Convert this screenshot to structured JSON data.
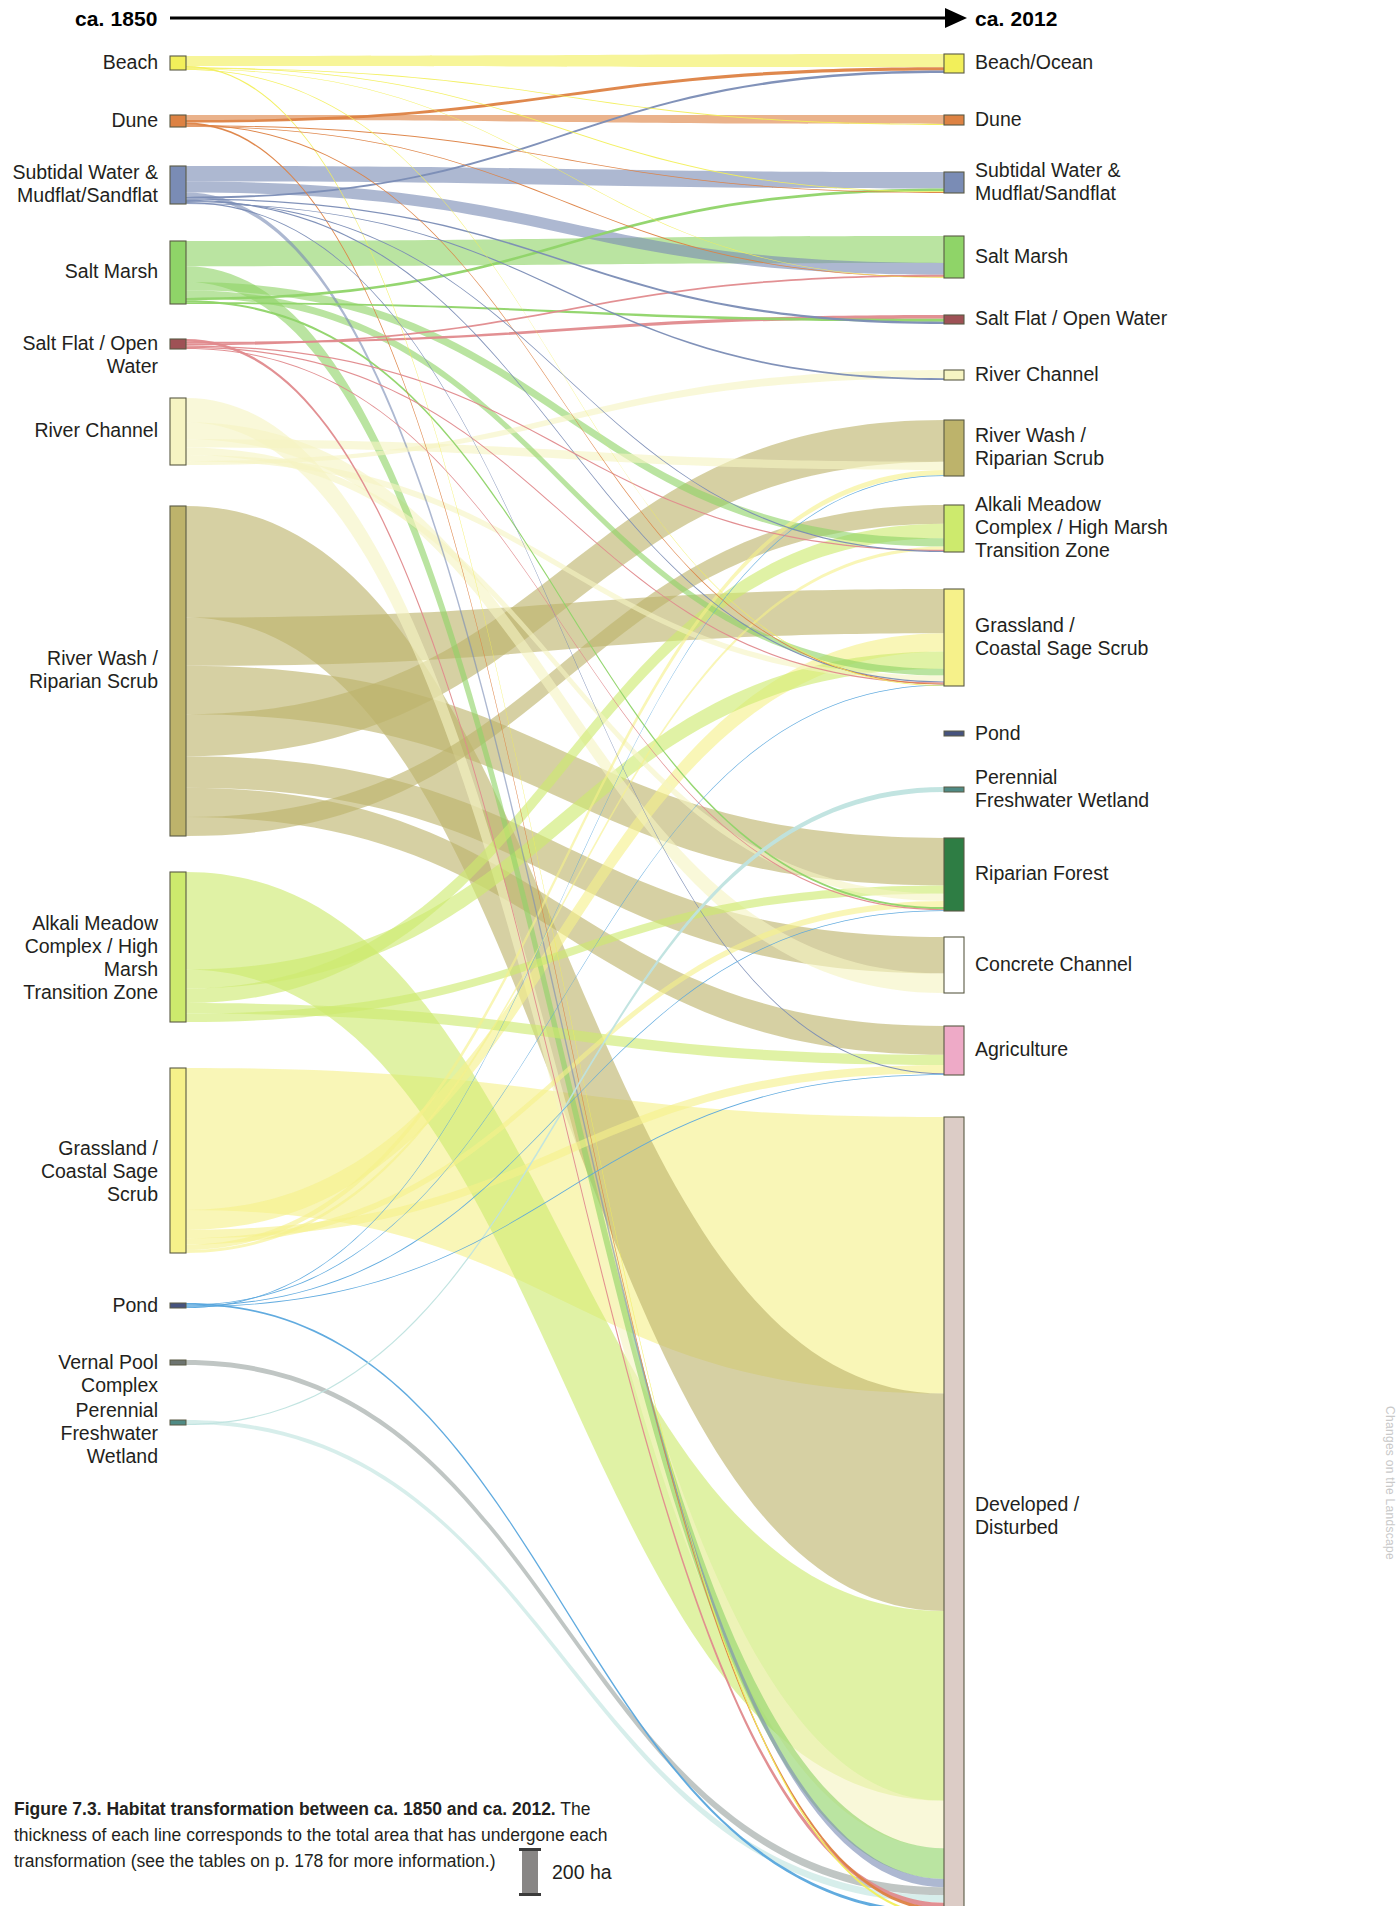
{
  "figure": {
    "axis_left_label": "ca. 1850",
    "axis_right_label": "ca. 2012",
    "caption_title": "Figure 7.3. Habitat transformation between ca. 1850 and ca. 2012.",
    "caption_body": "The thickness of each line corresponds to the total area that has undergone each transformation (see the tables on p. 178 for more information.)",
    "scale_label": "200 ha",
    "side_note": "Changes on the Landscape"
  },
  "chart_data": {
    "type": "sankey",
    "title": "Habitat transformation between ca. 1850 and ca. 2012",
    "units": "ha",
    "scale_reference_ha": 200,
    "scale_reference_px": 42,
    "xlabel": "",
    "ylabel": "",
    "legend_position": "none",
    "grid": false,
    "source_axis": "ca. 1850",
    "target_axis": "ca. 2012",
    "nodes_left": [
      {
        "id": "L-beach",
        "label": "Beach",
        "color": "#f2ef5a",
        "y": 56,
        "h": 14,
        "value": 66
      },
      {
        "id": "L-dune",
        "label": "Dune",
        "color": "#dd8243",
        "y": 115,
        "h": 12,
        "value": 57
      },
      {
        "id": "L-subtidal",
        "label": "Subtidal Water &\nMudflat/Sandflat",
        "color": "#7a8cb5",
        "y": 166,
        "h": 38,
        "value": 181
      },
      {
        "id": "L-saltmarsh",
        "label": "Salt Marsh",
        "color": "#8fd468",
        "y": 241,
        "h": 63,
        "value": 300
      },
      {
        "id": "L-saltflat",
        "label": "Salt Flat / Open Water",
        "color": "#9e5155",
        "y": 339,
        "h": 10,
        "value": 48
      },
      {
        "id": "L-riverchannel",
        "label": "River Channel",
        "color": "#f6f4c2",
        "y": 398,
        "h": 67,
        "value": 319
      },
      {
        "id": "L-riverwash",
        "label": "River Wash /\nRiparian Scrub",
        "color": "#bdb36b",
        "y": 506,
        "h": 330,
        "value": 1571
      },
      {
        "id": "L-alkali",
        "label": "Alkali Meadow\nComplex / High Marsh\nTransition Zone",
        "color": "#cdea6d",
        "y": 872,
        "h": 150,
        "value": 714
      },
      {
        "id": "L-grassland",
        "label": "Grassland /\nCoastal Sage Scrub",
        "color": "#f6f18a",
        "y": 1068,
        "h": 185,
        "value": 881
      },
      {
        "id": "L-pond",
        "label": "Pond",
        "color": "#46537e",
        "y": 1303,
        "h": 5,
        "value": 24
      },
      {
        "id": "L-vernal",
        "label": "Vernal Pool Complex",
        "color": "#6d7470",
        "y": 1360,
        "h": 5,
        "value": 24
      },
      {
        "id": "L-perennial",
        "label": "Perennial\nFreshwater Wetland",
        "color": "#4f8a84",
        "y": 1420,
        "h": 5,
        "value": 24
      }
    ],
    "nodes_right": [
      {
        "id": "R-beach",
        "label": "Beach/Ocean",
        "color": "#f2ef5a",
        "y": 54,
        "h": 19,
        "value": 90
      },
      {
        "id": "R-dune",
        "label": "Dune",
        "color": "#dd8243",
        "y": 115,
        "h": 10,
        "value": 48
      },
      {
        "id": "R-subtidal",
        "label": "Subtidal Water &\nMudflat/Sandflat",
        "color": "#7a8cb5",
        "y": 172,
        "h": 21,
        "value": 100
      },
      {
        "id": "R-saltmarsh",
        "label": "Salt Marsh",
        "color": "#8fd468",
        "y": 236,
        "h": 42,
        "value": 200
      },
      {
        "id": "R-saltflat",
        "label": "Salt Flat / Open Water",
        "color": "#9e5155",
        "y": 315,
        "h": 9,
        "value": 43
      },
      {
        "id": "R-riverchannel",
        "label": "River Channel",
        "color": "#f6f4c2",
        "y": 370,
        "h": 10,
        "value": 48
      },
      {
        "id": "R-riverwash",
        "label": "River Wash /\nRiparian Scrub",
        "color": "#bdb36b",
        "y": 420,
        "h": 56,
        "value": 267
      },
      {
        "id": "R-alkali",
        "label": "Alkali Meadow\nComplex / High Marsh\n Transition Zone",
        "color": "#cdea6d",
        "y": 505,
        "h": 47,
        "value": 224
      },
      {
        "id": "R-grassland",
        "label": "Grassland /\nCoastal Sage Scrub",
        "color": "#f6f18a",
        "y": 589,
        "h": 97,
        "value": 462
      },
      {
        "id": "R-pond",
        "label": "Pond",
        "color": "#46537e",
        "y": 731,
        "h": 5,
        "value": 24
      },
      {
        "id": "R-perennial",
        "label": "Perennial\nFreshwater Wetland",
        "color": "#4f8a84",
        "y": 787,
        "h": 5,
        "value": 24
      },
      {
        "id": "R-riparianforest",
        "label": "Riparian Forest",
        "color": "#2e7d44",
        "y": 838,
        "h": 73,
        "value": 348
      },
      {
        "id": "R-concrete",
        "label": "Concrete Channel",
        "color": "#ffffff",
        "y": 937,
        "h": 56,
        "value": 267
      },
      {
        "id": "R-agriculture",
        "label": "Agriculture",
        "color": "#eeaac7",
        "y": 1026,
        "h": 49,
        "value": 233
      },
      {
        "id": "R-developed",
        "label": "Developed /\nDisturbed",
        "color": "#dcccc6",
        "y": 1117,
        "h": 800,
        "value": 3810
      }
    ],
    "links": [
      {
        "source": "L-beach",
        "target": "R-beach",
        "value": 47,
        "color": "#f2ef5a"
      },
      {
        "source": "L-beach",
        "target": "R-dune",
        "value": 3,
        "color": "#f2ef5a"
      },
      {
        "source": "L-beach",
        "target": "R-subtidal",
        "value": 4,
        "color": "#f2ef5a"
      },
      {
        "source": "L-beach",
        "target": "R-saltmarsh",
        "value": 3,
        "color": "#f2ef5a"
      },
      {
        "source": "L-beach",
        "target": "R-grassland",
        "value": 3,
        "color": "#f2ef5a"
      },
      {
        "source": "L-beach",
        "target": "R-developed",
        "value": 6,
        "color": "#f2ef5a"
      },
      {
        "source": "L-dune",
        "target": "R-dune",
        "value": 24,
        "color": "#dd8243"
      },
      {
        "source": "L-dune",
        "target": "R-beach",
        "value": 12,
        "color": "#dd8243"
      },
      {
        "source": "L-dune",
        "target": "R-subtidal",
        "value": 4,
        "color": "#dd8243"
      },
      {
        "source": "L-dune",
        "target": "R-saltmarsh",
        "value": 4,
        "color": "#dd8243"
      },
      {
        "source": "L-dune",
        "target": "R-grassland",
        "value": 5,
        "color": "#dd8243"
      },
      {
        "source": "L-dune",
        "target": "R-developed",
        "value": 8,
        "color": "#dd8243"
      },
      {
        "source": "L-subtidal",
        "target": "R-subtidal",
        "value": 74,
        "color": "#7a8cb5"
      },
      {
        "source": "L-subtidal",
        "target": "R-saltmarsh",
        "value": 52,
        "color": "#7a8cb5"
      },
      {
        "source": "L-subtidal",
        "target": "R-beach",
        "value": 9,
        "color": "#7a8cb5"
      },
      {
        "source": "L-subtidal",
        "target": "R-saltflat",
        "value": 6,
        "color": "#7a8cb5"
      },
      {
        "source": "L-subtidal",
        "target": "R-riverchannel",
        "value": 4,
        "color": "#7a8cb5"
      },
      {
        "source": "L-subtidal",
        "target": "R-alkali",
        "value": 5,
        "color": "#7a8cb5"
      },
      {
        "source": "L-subtidal",
        "target": "R-grassland",
        "value": 6,
        "color": "#7a8cb5"
      },
      {
        "source": "L-subtidal",
        "target": "R-agriculture",
        "value": 5,
        "color": "#7a8cb5"
      },
      {
        "source": "L-subtidal",
        "target": "R-developed",
        "value": 20,
        "color": "#7a8cb5"
      },
      {
        "source": "L-saltmarsh",
        "target": "R-saltmarsh",
        "value": 120,
        "color": "#8fd468"
      },
      {
        "source": "L-saltmarsh",
        "target": "R-alkali",
        "value": 40,
        "color": "#8fd468"
      },
      {
        "source": "L-saltmarsh",
        "target": "R-grassland",
        "value": 35,
        "color": "#8fd468"
      },
      {
        "source": "L-saltmarsh",
        "target": "R-subtidal",
        "value": 12,
        "color": "#8fd468"
      },
      {
        "source": "L-saltmarsh",
        "target": "R-saltflat",
        "value": 8,
        "color": "#8fd468"
      },
      {
        "source": "L-saltmarsh",
        "target": "R-riparianforest",
        "value": 10,
        "color": "#8fd468"
      },
      {
        "source": "L-saltmarsh",
        "target": "R-developed",
        "value": 75,
        "color": "#8fd468"
      },
      {
        "source": "L-saltflat",
        "target": "R-saltflat",
        "value": 10,
        "color": "#e08a8d"
      },
      {
        "source": "L-saltflat",
        "target": "R-saltmarsh",
        "value": 8,
        "color": "#e08a8d"
      },
      {
        "source": "L-saltflat",
        "target": "R-alkali",
        "value": 6,
        "color": "#e08a8d"
      },
      {
        "source": "L-saltflat",
        "target": "R-grassland",
        "value": 6,
        "color": "#e08a8d"
      },
      {
        "source": "L-saltflat",
        "target": "R-riparianforest",
        "value": 5,
        "color": "#e08a8d"
      },
      {
        "source": "L-saltflat",
        "target": "R-developed",
        "value": 13,
        "color": "#e08a8d"
      },
      {
        "source": "L-riverchannel",
        "target": "R-riverwash",
        "value": 40,
        "color": "#f6f4c2"
      },
      {
        "source": "L-riverchannel",
        "target": "R-riverchannel",
        "value": 18,
        "color": "#f6f4c2"
      },
      {
        "source": "L-riverchannel",
        "target": "R-concrete",
        "value": 80,
        "color": "#f6f4c2"
      },
      {
        "source": "L-riverchannel",
        "target": "R-riparianforest",
        "value": 35,
        "color": "#f6f4c2"
      },
      {
        "source": "L-riverchannel",
        "target": "R-grassland",
        "value": 30,
        "color": "#f6f4c2"
      },
      {
        "source": "L-riverchannel",
        "target": "R-developed",
        "value": 116,
        "color": "#f6f4c2"
      },
      {
        "source": "L-riverwash",
        "target": "R-riverwash",
        "value": 200,
        "color": "#bdb36b"
      },
      {
        "source": "L-riverwash",
        "target": "R-alkali",
        "value": 90,
        "color": "#bdb36b"
      },
      {
        "source": "L-riverwash",
        "target": "R-grassland",
        "value": 230,
        "color": "#bdb36b"
      },
      {
        "source": "L-riverwash",
        "target": "R-riparianforest",
        "value": 230,
        "color": "#bdb36b"
      },
      {
        "source": "L-riverwash",
        "target": "R-concrete",
        "value": 150,
        "color": "#bdb36b"
      },
      {
        "source": "L-riverwash",
        "target": "R-agriculture",
        "value": 140,
        "color": "#bdb36b"
      },
      {
        "source": "L-riverwash",
        "target": "R-developed",
        "value": 531,
        "color": "#bdb36b"
      },
      {
        "source": "L-alkali",
        "target": "R-alkali",
        "value": 70,
        "color": "#cdea6d"
      },
      {
        "source": "L-alkali",
        "target": "R-grassland",
        "value": 90,
        "color": "#cdea6d"
      },
      {
        "source": "L-alkali",
        "target": "R-riparianforest",
        "value": 40,
        "color": "#cdea6d"
      },
      {
        "source": "L-alkali",
        "target": "R-agriculture",
        "value": 50,
        "color": "#cdea6d"
      },
      {
        "source": "L-alkali",
        "target": "R-developed",
        "value": 464,
        "color": "#cdea6d"
      },
      {
        "source": "L-grassland",
        "target": "R-grassland",
        "value": 95,
        "color": "#f6f18a"
      },
      {
        "source": "L-grassland",
        "target": "R-riverwash",
        "value": 25,
        "color": "#f6f18a"
      },
      {
        "source": "L-grassland",
        "target": "R-alkali",
        "value": 15,
        "color": "#f6f18a"
      },
      {
        "source": "L-grassland",
        "target": "R-riparianforest",
        "value": 30,
        "color": "#f6f18a"
      },
      {
        "source": "L-grassland",
        "target": "R-agriculture",
        "value": 40,
        "color": "#f6f18a"
      },
      {
        "source": "L-grassland",
        "target": "R-developed",
        "value": 676,
        "color": "#f6f18a"
      },
      {
        "source": "L-pond",
        "target": "R-grassland",
        "value": 4,
        "color": "#59a6dd"
      },
      {
        "source": "L-pond",
        "target": "R-riparianforest",
        "value": 4,
        "color": "#59a6dd"
      },
      {
        "source": "L-pond",
        "target": "R-agriculture",
        "value": 4,
        "color": "#59a6dd"
      },
      {
        "source": "L-pond",
        "target": "R-riverwash",
        "value": 4,
        "color": "#59a6dd"
      },
      {
        "source": "L-pond",
        "target": "R-developed",
        "value": 8,
        "color": "#59a6dd"
      },
      {
        "source": "L-vernal",
        "target": "R-developed",
        "value": 20,
        "color": "#9aa3a0"
      },
      {
        "source": "L-perennial",
        "target": "R-developed",
        "value": 18,
        "color": "#bfe3df"
      },
      {
        "source": "L-perennial",
        "target": "R-perennial",
        "value": 5,
        "color": "#bfe3df"
      }
    ]
  }
}
